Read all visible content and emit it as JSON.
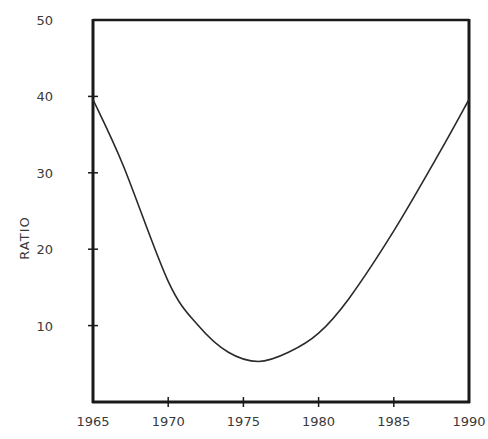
{
  "chart_data": {
    "type": "line",
    "title": "",
    "xlabel": "",
    "ylabel": "RATIO",
    "xlim": [
      1965,
      1990
    ],
    "ylim": [
      0,
      50
    ],
    "x_ticks": [
      1965,
      1970,
      1975,
      1980,
      1985,
      1990
    ],
    "y_ticks": [
      10,
      20,
      30,
      40,
      50
    ],
    "grid": false,
    "legend": null,
    "series": [
      {
        "name": "ratio",
        "x": [
          1965,
          1967,
          1970,
          1972,
          1974,
          1976,
          1978,
          1980,
          1982,
          1985,
          1988,
          1990
        ],
        "values": [
          39.6,
          31,
          15.8,
          10,
          6.5,
          5.3,
          6.5,
          9,
          13.5,
          22.4,
          32.5,
          39.6
        ]
      }
    ],
    "colors": {
      "line": "#2a2a2a",
      "axis": "#1a1a1a",
      "text": "#3a3a3a"
    }
  }
}
